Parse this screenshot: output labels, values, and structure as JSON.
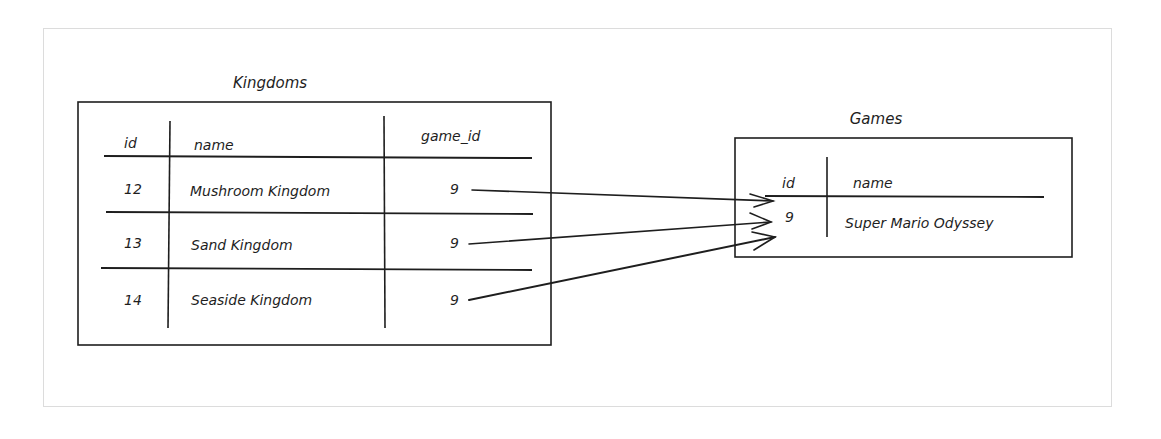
{
  "kingdoms": {
    "title": "Kingdoms",
    "columns": [
      "id",
      "name",
      "game_id"
    ],
    "rows": [
      {
        "id": "12",
        "name": "Mushroom Kingdom",
        "game_id": "9"
      },
      {
        "id": "13",
        "name": "Sand Kingdom",
        "game_id": "9"
      },
      {
        "id": "14",
        "name": "Seaside Kingdom",
        "game_id": "9"
      }
    ]
  },
  "games": {
    "title": "Games",
    "columns": [
      "id",
      "name"
    ],
    "rows": [
      {
        "id": "9",
        "name": "Super Mario Odyssey"
      }
    ]
  },
  "relationships": [
    {
      "from": "kingdoms.rows.0.game_id",
      "to": "games.rows.0.id"
    },
    {
      "from": "kingdoms.rows.1.game_id",
      "to": "games.rows.0.id"
    },
    {
      "from": "kingdoms.rows.2.game_id",
      "to": "games.rows.0.id"
    }
  ],
  "colors": {
    "stroke": "#1e1e1e",
    "frame": "#dcdcdc",
    "background": "#ffffff"
  }
}
